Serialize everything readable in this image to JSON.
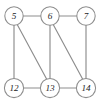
{
  "figure": {
    "kind": "undirected-graph-diagram",
    "background_color": "#ffffff",
    "edge_color": "#8d8d8d",
    "node_fill_color": "#ffffff",
    "node_stroke_color": "#8d8d8d",
    "label_color": "#1c1c1c",
    "width": 99,
    "height": 103
  },
  "nodes": [
    {
      "id": "5",
      "label": "5",
      "cx": 14,
      "cy": 16,
      "r": 9.2
    },
    {
      "id": "6",
      "label": "6",
      "cx": 50,
      "cy": 16,
      "r": 9.2
    },
    {
      "id": "7",
      "label": "7",
      "cx": 86,
      "cy": 16,
      "r": 9.2
    },
    {
      "id": "12",
      "label": "12",
      "cx": 14,
      "cy": 88,
      "r": 9.6
    },
    {
      "id": "13",
      "label": "13",
      "cx": 50,
      "cy": 88,
      "r": 9.6
    },
    {
      "id": "14",
      "label": "14",
      "cx": 86,
      "cy": 88,
      "r": 9.6
    }
  ],
  "edges": [
    {
      "id": "5-6",
      "source": "5",
      "target": "6",
      "x1": 23.2,
      "y1": 16,
      "x2": 40.8,
      "y2": 16
    },
    {
      "id": "6-7",
      "source": "6",
      "target": "7",
      "x1": 59.2,
      "y1": 16,
      "x2": 76.8,
      "y2": 16
    },
    {
      "id": "5-12",
      "source": "5",
      "target": "12",
      "x1": 14,
      "y1": 25.2,
      "x2": 14,
      "y2": 78.4
    },
    {
      "id": "5-13",
      "source": "5",
      "target": "13",
      "x1": 17.2,
      "y1": 24.6,
      "x2": 46.6,
      "y2": 79.0
    },
    {
      "id": "6-13",
      "source": "6",
      "target": "13",
      "x1": 50,
      "y1": 25.2,
      "x2": 50,
      "y2": 78.4
    },
    {
      "id": "6-14",
      "source": "6",
      "target": "14",
      "x1": 53.2,
      "y1": 24.6,
      "x2": 82.6,
      "y2": 79.0
    },
    {
      "id": "7-14",
      "source": "7",
      "target": "14",
      "x1": 86,
      "y1": 25.2,
      "x2": 86,
      "y2": 78.4
    },
    {
      "id": "12-13",
      "source": "12",
      "target": "13",
      "x1": 23.6,
      "y1": 88,
      "x2": 40.4,
      "y2": 88
    },
    {
      "id": "13-14",
      "source": "13",
      "target": "14",
      "x1": 59.6,
      "y1": 88,
      "x2": 76.4,
      "y2": 88
    }
  ]
}
